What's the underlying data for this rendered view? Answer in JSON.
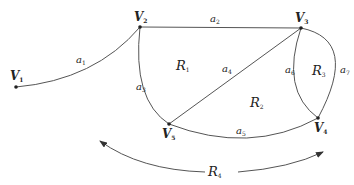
{
  "diagram": {
    "type": "planar-graph",
    "vertices": [
      {
        "id": "V1",
        "label": "V",
        "sub": "1",
        "x": 16,
        "y": 87
      },
      {
        "id": "V2",
        "label": "V",
        "sub": "2",
        "x": 140,
        "y": 27
      },
      {
        "id": "V3",
        "label": "V",
        "sub": "3",
        "x": 301,
        "y": 28
      },
      {
        "id": "V4",
        "label": "V",
        "sub": "4",
        "x": 318,
        "y": 118
      },
      {
        "id": "V5",
        "label": "V",
        "sub": "5",
        "x": 169,
        "y": 124
      }
    ],
    "edges": [
      {
        "id": "a1",
        "label": "a",
        "sub": "1",
        "from": "V1",
        "to": "V2"
      },
      {
        "id": "a2",
        "label": "a",
        "sub": "2",
        "from": "V2",
        "to": "V3"
      },
      {
        "id": "a3",
        "label": "a",
        "sub": "3",
        "from": "V2",
        "to": "V5"
      },
      {
        "id": "a4",
        "label": "a",
        "sub": "4",
        "from": "V5",
        "to": "V3"
      },
      {
        "id": "a5",
        "label": "a",
        "sub": "5",
        "from": "V5",
        "to": "V4"
      },
      {
        "id": "a6",
        "label": "a",
        "sub": "6",
        "from": "V3",
        "to": "V4"
      },
      {
        "id": "a7",
        "label": "a",
        "sub": "7",
        "from": "V3",
        "to": "V4"
      }
    ],
    "regions": [
      {
        "id": "R1",
        "label": "R",
        "sub": "1"
      },
      {
        "id": "R2",
        "label": "R",
        "sub": "2"
      },
      {
        "id": "R3",
        "label": "R",
        "sub": "3"
      },
      {
        "id": "R4",
        "label": "R",
        "sub": "4",
        "note": "outer region (double-headed arrow)"
      }
    ]
  }
}
